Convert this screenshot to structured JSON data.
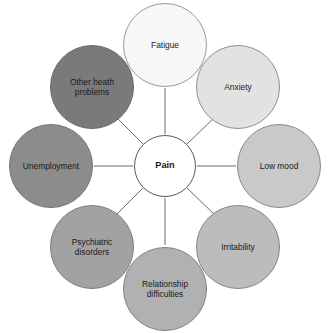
{
  "diagram": {
    "type": "radial-hub-and-spoke",
    "center": {
      "label": "Pain",
      "fill": "#ffffff",
      "stroke": "#595959",
      "text_color": "#1a1a1a"
    },
    "line_color": "#6b6b6b",
    "background": "#ffffff",
    "satellites": [
      {
        "label": "Fatigue",
        "position": "top",
        "fill": "#f7f7f7",
        "stroke": "#9a9a9a",
        "angle_deg": 270
      },
      {
        "label": "Anxiety",
        "position": "top-right",
        "fill": "#e2e2e2",
        "stroke": "#909090",
        "angle_deg": 315
      },
      {
        "label": "Low mood",
        "position": "right",
        "fill": "#c9c9c9",
        "stroke": "#8a8a8a",
        "angle_deg": 0
      },
      {
        "label": "Irritability",
        "position": "bottom-right",
        "fill": "#bcbcbc",
        "stroke": "#868686",
        "angle_deg": 45
      },
      {
        "label": "Relationship\ndifficulties",
        "position": "bottom",
        "fill": "#b1b1b1",
        "stroke": "#828282",
        "angle_deg": 90
      },
      {
        "label": "Psychiatric\ndisorders",
        "position": "bottom-left",
        "fill": "#a2a2a2",
        "stroke": "#7c7c7c",
        "angle_deg": 135
      },
      {
        "label": "Unemployment",
        "position": "left",
        "fill": "#8c8c8c",
        "stroke": "#747474",
        "angle_deg": 180
      },
      {
        "label": "Other heath\nproblems",
        "position": "top-left",
        "fill": "#7a7a7a",
        "stroke": "#6a6a6a",
        "angle_deg": 225
      }
    ]
  }
}
